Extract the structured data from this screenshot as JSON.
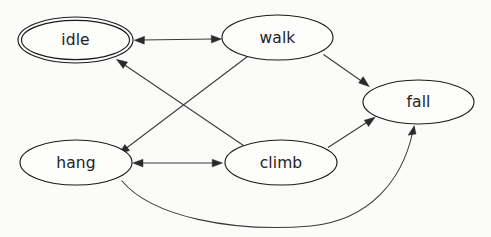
{
  "diagram": {
    "type": "state-machine",
    "title": "",
    "background_color": "#fbfbfa",
    "node_fill_color": "#fdfdfc",
    "node_stroke_color": "#1c1c1c",
    "edge_color": "#3a3a3a",
    "label_color": "#232323",
    "nodes": [
      {
        "id": "idle",
        "label": "idle",
        "cx": 75.5,
        "cy": 40,
        "rx": 57.5,
        "ry": 23,
        "shape": "doublecircle",
        "accepting": true
      },
      {
        "id": "walk",
        "label": "walk",
        "cx": 277.5,
        "cy": 37.5,
        "rx": 55.5,
        "ry": 22.5,
        "shape": "ellipse",
        "accepting": false
      },
      {
        "id": "fall",
        "label": "fall",
        "cx": 418.5,
        "cy": 102,
        "rx": 55.5,
        "ry": 22,
        "shape": "ellipse",
        "accepting": false
      },
      {
        "id": "hang",
        "label": "hang",
        "cx": 76,
        "cy": 162.5,
        "rx": 56,
        "ry": 22.5,
        "shape": "ellipse",
        "accepting": false
      },
      {
        "id": "climb",
        "label": "climb",
        "cx": 281,
        "cy": 162.5,
        "rx": 56,
        "ry": 22.5,
        "shape": "ellipse",
        "accepting": false
      }
    ],
    "edges": [
      {
        "id": "idle-walk",
        "from": "idle",
        "to": "walk",
        "label": "",
        "directed": "both",
        "path": "M 133.5 40 L 221.5 39"
      },
      {
        "id": "walk-hang",
        "from": "walk",
        "to": "hang",
        "label": "",
        "directed": "forward",
        "path": "M 247 56 L 120 152"
      },
      {
        "id": "climb-idle",
        "from": "climb",
        "to": "idle",
        "label": "",
        "directed": "forward",
        "path": "M 243 145 L 117 59"
      },
      {
        "id": "walk-fall",
        "from": "walk",
        "to": "fall",
        "label": "",
        "directed": "forward",
        "path": "M 323 54 L 368 86"
      },
      {
        "id": "climb-fall",
        "from": "climb",
        "to": "fall",
        "label": "",
        "directed": "forward",
        "path": "M 328 147 L 373 119"
      },
      {
        "id": "hang-climb",
        "from": "hang",
        "to": "climb",
        "label": "",
        "directed": "both",
        "path": "M 132.5 163 L 222.5 163"
      },
      {
        "id": "hang-fall",
        "from": "hang",
        "to": "fall",
        "label": "",
        "directed": "forward",
        "path": "M 121 180 C 150 218 230 232 310 226 C 372 221 405 178 415 128"
      }
    ]
  }
}
